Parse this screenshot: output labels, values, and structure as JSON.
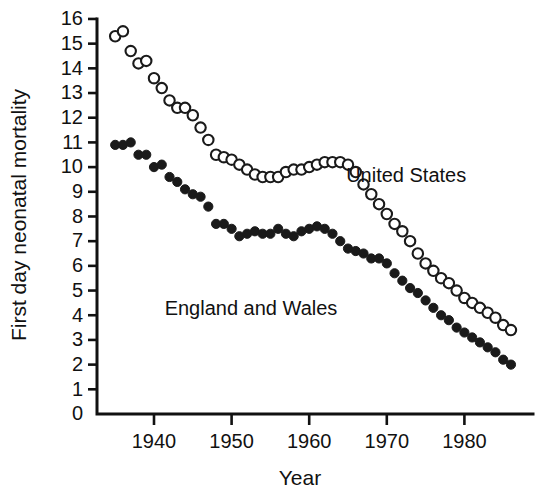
{
  "chart_data": {
    "type": "scatter",
    "title": "",
    "xlabel": "Year",
    "ylabel": "First day neonatal mortality",
    "xlim": [
      1934,
      1988
    ],
    "ylim": [
      0,
      16
    ],
    "grid": false,
    "legend_position": "inline-annotation",
    "xticks": [
      1940,
      1950,
      1960,
      1970,
      1980
    ],
    "xtick_labels": [
      "1940",
      "1950",
      "1960",
      "1970",
      "1980"
    ],
    "yticks": [
      0,
      1,
      2,
      3,
      4,
      5,
      6,
      7,
      8,
      9,
      10,
      11,
      12,
      13,
      14,
      15,
      16
    ],
    "ytick_labels": [
      "0",
      "1",
      "2",
      "3",
      "4",
      "5",
      "6",
      "7",
      "8",
      "9",
      "10",
      "11",
      "12",
      "13",
      "14",
      "15",
      "16"
    ],
    "annotations": [
      {
        "text": "United States",
        "x": 1972.5,
        "y": 9.4
      },
      {
        "text": "England and Wales",
        "x": 1952.5,
        "y": 4.0
      }
    ],
    "series": [
      {
        "name": "United States",
        "marker": "open-circle",
        "color": "#1a1a1a",
        "x": [
          1935,
          1936,
          1937,
          1938,
          1939,
          1940,
          1941,
          1942,
          1943,
          1944,
          1945,
          1946,
          1947,
          1948,
          1949,
          1950,
          1951,
          1952,
          1953,
          1954,
          1955,
          1956,
          1957,
          1958,
          1959,
          1960,
          1961,
          1962,
          1963,
          1964,
          1965,
          1966,
          1967,
          1968,
          1969,
          1970,
          1971,
          1972,
          1973,
          1974,
          1975,
          1976,
          1977,
          1978,
          1979,
          1980,
          1981,
          1982,
          1983,
          1984,
          1985,
          1986
        ],
        "y": [
          15.3,
          15.5,
          14.7,
          14.2,
          14.3,
          13.6,
          13.2,
          12.7,
          12.4,
          12.4,
          12.1,
          11.6,
          11.1,
          10.5,
          10.4,
          10.3,
          10.1,
          9.9,
          9.7,
          9.6,
          9.6,
          9.6,
          9.8,
          9.9,
          9.9,
          10.0,
          10.1,
          10.2,
          10.2,
          10.2,
          10.1,
          9.8,
          9.3,
          8.9,
          8.5,
          8.1,
          7.7,
          7.4,
          7.0,
          6.5,
          6.1,
          5.8,
          5.5,
          5.3,
          5.0,
          4.7,
          4.5,
          4.3,
          4.1,
          3.9,
          3.6,
          3.4
        ]
      },
      {
        "name": "England and Wales",
        "marker": "filled-circle",
        "color": "#1a1a1a",
        "x": [
          1935,
          1936,
          1937,
          1938,
          1939,
          1940,
          1941,
          1942,
          1943,
          1944,
          1945,
          1946,
          1947,
          1948,
          1949,
          1950,
          1951,
          1952,
          1953,
          1954,
          1955,
          1956,
          1957,
          1958,
          1959,
          1960,
          1961,
          1962,
          1963,
          1964,
          1965,
          1966,
          1967,
          1968,
          1969,
          1970,
          1971,
          1972,
          1973,
          1974,
          1975,
          1976,
          1977,
          1978,
          1979,
          1980,
          1981,
          1982,
          1983,
          1984,
          1985,
          1986
        ],
        "y": [
          10.9,
          10.9,
          11.0,
          10.5,
          10.5,
          10.0,
          10.1,
          9.6,
          9.4,
          9.1,
          8.9,
          8.8,
          8.4,
          7.7,
          7.7,
          7.5,
          7.2,
          7.3,
          7.4,
          7.3,
          7.3,
          7.5,
          7.3,
          7.2,
          7.4,
          7.5,
          7.6,
          7.5,
          7.3,
          7.0,
          6.7,
          6.6,
          6.5,
          6.3,
          6.3,
          6.1,
          5.7,
          5.4,
          5.1,
          4.9,
          4.6,
          4.3,
          4.0,
          3.8,
          3.5,
          3.3,
          3.1,
          2.9,
          2.7,
          2.5,
          2.2,
          2.0
        ]
      }
    ]
  }
}
